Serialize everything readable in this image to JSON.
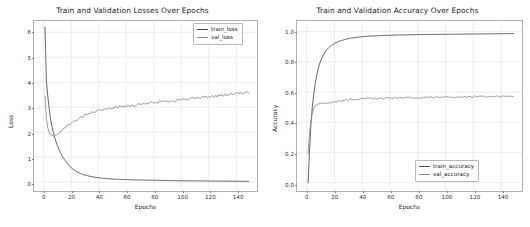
{
  "figure": {
    "background": "#ffffff",
    "width": 530,
    "height": 227
  },
  "colors": {
    "train_loss": "#4a4a4a",
    "val_loss": "#8a8a8a",
    "train_accuracy": "#4a4a4a",
    "val_accuracy": "#8a8a8a",
    "grid": "#e8e8e8",
    "axis": "#b0b0b0",
    "text": "#1a1a1a"
  },
  "chart_data": [
    {
      "id": "loss-chart",
      "type": "line",
      "title": "Train and Validation Losses Over Epochs",
      "xlabel": "Epochs",
      "ylabel": "Loss",
      "xlim": [
        -7,
        155
      ],
      "ylim": [
        -0.35,
        6.45
      ],
      "xticks": [
        0,
        20,
        40,
        60,
        80,
        100,
        120,
        140
      ],
      "xticklabels": [
        "0",
        "20",
        "40",
        "60",
        "80",
        "100",
        "120",
        "140"
      ],
      "yticks": [
        0,
        1,
        2,
        3,
        4,
        5,
        6
      ],
      "yticklabels": [
        "0",
        "1",
        "2",
        "3",
        "4",
        "5",
        "6"
      ],
      "grid": true,
      "legend_position": "upper right",
      "x": [
        1,
        2,
        3,
        4,
        5,
        6,
        7,
        8,
        9,
        10,
        12,
        14,
        16,
        18,
        20,
        24,
        28,
        32,
        36,
        40,
        45,
        50,
        55,
        60,
        65,
        70,
        75,
        80,
        85,
        90,
        95,
        100,
        105,
        110,
        115,
        120,
        125,
        130,
        135,
        140,
        145,
        149
      ],
      "series": [
        {
          "name": "train_loss",
          "color": "#4a4a4a",
          "values": [
            6.2,
            4.05,
            3.45,
            2.95,
            2.55,
            2.25,
            2.0,
            1.8,
            1.62,
            1.46,
            1.2,
            1.0,
            0.84,
            0.7,
            0.58,
            0.42,
            0.32,
            0.26,
            0.21,
            0.18,
            0.15,
            0.13,
            0.115,
            0.105,
            0.095,
            0.09,
            0.085,
            0.08,
            0.075,
            0.07,
            0.065,
            0.06,
            0.058,
            0.055,
            0.052,
            0.05,
            0.047,
            0.045,
            0.042,
            0.04,
            0.038,
            0.035
          ]
        },
        {
          "name": "val_loss",
          "color": "#8a8a8a",
          "values": [
            3.45,
            2.55,
            2.18,
            2.0,
            1.9,
            1.85,
            1.84,
            1.86,
            1.9,
            1.95,
            2.04,
            2.12,
            2.2,
            2.3,
            2.38,
            2.5,
            2.62,
            2.72,
            2.8,
            2.86,
            2.93,
            2.98,
            3.02,
            3.05,
            3.08,
            3.12,
            3.15,
            3.18,
            3.22,
            3.25,
            3.27,
            3.3,
            3.33,
            3.36,
            3.4,
            3.42,
            3.45,
            3.48,
            3.52,
            3.54,
            3.57,
            3.58
          ]
        }
      ],
      "legend": [
        {
          "label": "train_loss",
          "color": "#4a4a4a"
        },
        {
          "label": "val_loss",
          "color": "#8a8a8a"
        }
      ]
    },
    {
      "id": "accuracy-chart",
      "type": "line",
      "title": "Train and Validation Accuracy Over Epochs",
      "xlabel": "Epochs",
      "ylabel": "Accuracy",
      "xlim": [
        -7,
        155
      ],
      "ylim": [
        -0.055,
        1.07
      ],
      "xticks": [
        0,
        20,
        40,
        60,
        80,
        100,
        120,
        140
      ],
      "xticklabels": [
        "0",
        "20",
        "40",
        "60",
        "80",
        "100",
        "120",
        "140"
      ],
      "yticks": [
        0.0,
        0.2,
        0.4,
        0.6,
        0.8,
        1.0
      ],
      "yticklabels": [
        "0.0",
        "0.2",
        "0.4",
        "0.6",
        "0.8",
        "1.0"
      ],
      "grid": true,
      "legend_position": "lower right",
      "x": [
        1,
        2,
        3,
        4,
        5,
        6,
        7,
        8,
        9,
        10,
        12,
        14,
        16,
        18,
        20,
        24,
        28,
        32,
        36,
        40,
        45,
        50,
        55,
        60,
        65,
        70,
        75,
        80,
        85,
        90,
        95,
        100,
        105,
        110,
        115,
        120,
        125,
        130,
        135,
        140,
        145,
        149
      ],
      "series": [
        {
          "name": "train_accuracy",
          "color": "#4a4a4a",
          "values": [
            0.0,
            0.2,
            0.38,
            0.5,
            0.58,
            0.65,
            0.7,
            0.745,
            0.78,
            0.805,
            0.845,
            0.875,
            0.895,
            0.91,
            0.922,
            0.938,
            0.949,
            0.957,
            0.962,
            0.966,
            0.97,
            0.972,
            0.974,
            0.9755,
            0.977,
            0.978,
            0.979,
            0.98,
            0.9805,
            0.981,
            0.9815,
            0.982,
            0.9825,
            0.983,
            0.9835,
            0.984,
            0.9845,
            0.985,
            0.9855,
            0.986,
            0.9865,
            0.987
          ]
        },
        {
          "name": "val_accuracy",
          "color": "#8a8a8a",
          "values": [
            0.19,
            0.33,
            0.41,
            0.46,
            0.49,
            0.505,
            0.513,
            0.517,
            0.519,
            0.521,
            0.524,
            0.527,
            0.53,
            0.533,
            0.536,
            0.541,
            0.545,
            0.549,
            0.553,
            0.558,
            0.56,
            0.558,
            0.559,
            0.561,
            0.56,
            0.562,
            0.563,
            0.562,
            0.564,
            0.565,
            0.564,
            0.566,
            0.567,
            0.566,
            0.568,
            0.569,
            0.568,
            0.57,
            0.571,
            0.57,
            0.572,
            0.573
          ]
        }
      ],
      "legend": [
        {
          "label": "train_accuracy",
          "color": "#4a4a4a"
        },
        {
          "label": "val_accuracy",
          "color": "#8a8a8a"
        }
      ]
    }
  ]
}
